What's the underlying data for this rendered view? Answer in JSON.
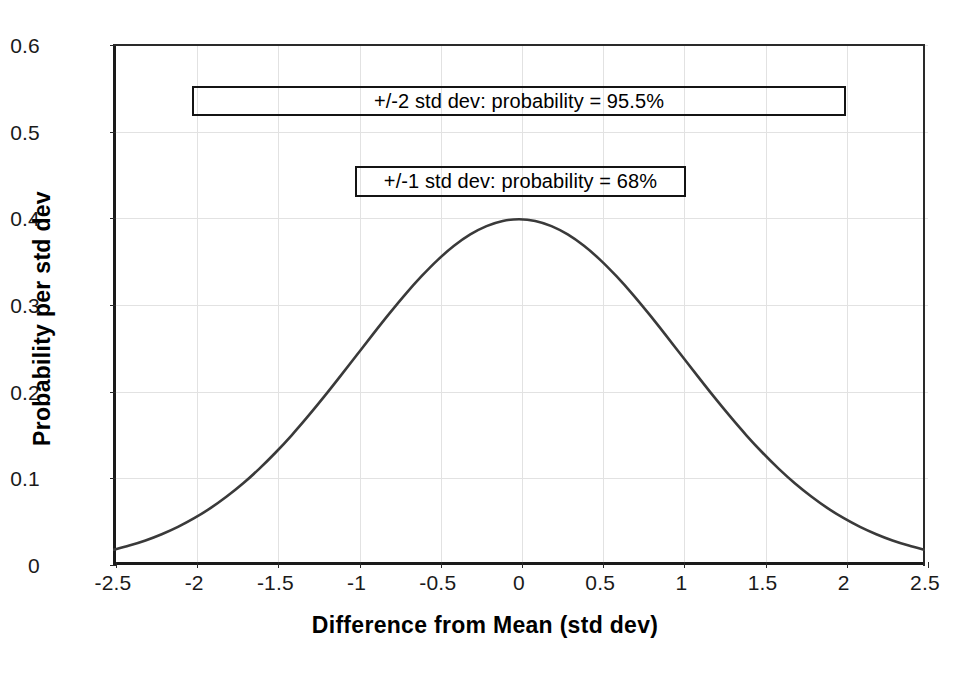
{
  "chart_data": {
    "type": "line",
    "title": "",
    "subtitle": "",
    "xlabel": "Difference from Mean (std dev)",
    "ylabel": "Probability per std dev",
    "xlim": [
      -2.5,
      2.5
    ],
    "ylim": [
      0,
      0.6
    ],
    "grid": true,
    "legend": "none",
    "line_color": "#3a3a3a",
    "xticks": [
      -2.5,
      -2,
      -1.5,
      -1,
      -0.5,
      0,
      0.5,
      1,
      1.5,
      2,
      2.5
    ],
    "xtick_labels": [
      "-2.5",
      "-2",
      "-1.5",
      "-1",
      "-0.5",
      "0",
      "0.5",
      "1",
      "1.5",
      "2",
      "2.5"
    ],
    "yticks": [
      0,
      0.1,
      0.2,
      0.3,
      0.4,
      0.5,
      0.6
    ],
    "ytick_labels": [
      "0",
      "0.1",
      "0.2",
      "0.3",
      "0.4",
      "0.5",
      "0.6"
    ],
    "series": [
      {
        "name": "Standard normal probability density",
        "x": [
          -2.5,
          -2.4,
          -2.3,
          -2.2,
          -2.1,
          -2.0,
          -1.9,
          -1.8,
          -1.7,
          -1.6,
          -1.5,
          -1.4,
          -1.3,
          -1.2,
          -1.1,
          -1.0,
          -0.9,
          -0.8,
          -0.7,
          -0.6,
          -0.5,
          -0.4,
          -0.3,
          -0.2,
          -0.1,
          0.0,
          0.1,
          0.2,
          0.3,
          0.4,
          0.5,
          0.6,
          0.7,
          0.8,
          0.9,
          1.0,
          1.1,
          1.2,
          1.3,
          1.4,
          1.5,
          1.6,
          1.7,
          1.8,
          1.9,
          2.0,
          2.1,
          2.2,
          2.3,
          2.4,
          2.5
        ],
        "y": [
          0.0175,
          0.0224,
          0.0283,
          0.0355,
          0.044,
          0.054,
          0.0656,
          0.079,
          0.094,
          0.1109,
          0.1295,
          0.1497,
          0.1714,
          0.1942,
          0.2179,
          0.242,
          0.2661,
          0.2897,
          0.3123,
          0.3332,
          0.3521,
          0.3683,
          0.3814,
          0.391,
          0.397,
          0.3989,
          0.397,
          0.391,
          0.3814,
          0.3683,
          0.3521,
          0.3332,
          0.3123,
          0.2897,
          0.2661,
          0.242,
          0.2179,
          0.1942,
          0.1714,
          0.1497,
          0.1295,
          0.1109,
          0.094,
          0.079,
          0.0656,
          0.054,
          0.044,
          0.0355,
          0.0283,
          0.0224,
          0.0175
        ]
      }
    ],
    "annotations": [
      {
        "id": "annotation-2sd",
        "text": "+/-2 std dev: probability = 95.5%",
        "x_range": [
          -2,
          2
        ],
        "y": 0.545
      },
      {
        "id": "annotation-1sd",
        "text": "+/-1 std dev: probability = 68%",
        "x_range": [
          -1,
          1
        ],
        "y": 0.455
      }
    ]
  }
}
